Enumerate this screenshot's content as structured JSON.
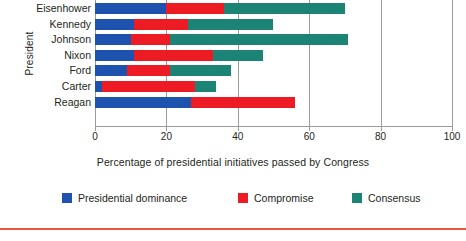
{
  "chart_data": {
    "type": "bar",
    "orientation": "horizontal",
    "stacked": true,
    "title": "",
    "xlabel": "Percentage of presidential initiatives passed by Congress",
    "ylabel": "President",
    "xlim": [
      0,
      100
    ],
    "xticks": [
      0,
      20,
      40,
      60,
      80,
      100
    ],
    "xtick_labels": [
      "0",
      "20",
      "40",
      "60",
      "80",
      "100"
    ],
    "grid": "vertical",
    "legend_position": "bottom",
    "categories": [
      "Eisenhower",
      "Kennedy",
      "Johnson",
      "Nixon",
      "Ford",
      "Carter",
      "Reagan"
    ],
    "series": [
      {
        "name": "Presidential dominance",
        "color": "#1d52ae",
        "values": [
          20,
          11,
          10,
          11,
          9,
          2,
          27
        ]
      },
      {
        "name": "Compromise",
        "color": "#ed1c24",
        "values": [
          16,
          15,
          11,
          22,
          12,
          26,
          29
        ]
      },
      {
        "name": "Consensus",
        "color": "#1b8474",
        "values": [
          34,
          24,
          50,
          14,
          17,
          6,
          0
        ]
      }
    ],
    "totals": [
      70,
      50,
      71,
      47,
      38,
      34,
      56
    ]
  },
  "axes": {
    "y_title": "President",
    "x_title": "Percentage of presidential initiatives passed by Congress",
    "tick_labels": [
      "0",
      "20",
      "40",
      "60",
      "80",
      "100"
    ]
  },
  "legend": {
    "items": [
      {
        "label": "Presidential  dominance",
        "color": "#1d52ae"
      },
      {
        "label": "Compromise",
        "color": "#ed1c24"
      },
      {
        "label": "Consensus",
        "color": "#1b8474"
      }
    ]
  },
  "colors": {
    "presidential_dominance": "#1d52ae",
    "compromise": "#ed1c24",
    "consensus": "#1b8474",
    "gridline": "#9b9b9b",
    "rule": "#e8563c",
    "text": "#231f20"
  }
}
